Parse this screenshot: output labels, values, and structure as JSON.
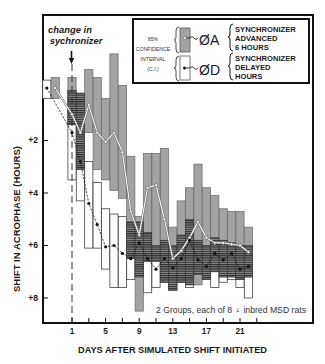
{
  "chart_data": {
    "type": "box-line",
    "title": "",
    "xlabel": "DAYS AFTER SIMULATED SHIFT INITIATED",
    "ylabel": "SHIFT IN ACROPHASE (HOURS)",
    "xlim": [
      -3.0,
      29.8
    ],
    "ylim": [
      -2.8,
      8.9
    ],
    "y_inverted": true,
    "grid": false,
    "x_ticks": [
      1,
      3,
      5,
      7,
      9,
      11,
      13,
      15,
      17,
      19,
      21,
      23
    ],
    "x_tick_labels": [
      {
        "value": 1,
        "label": "1"
      },
      {
        "value": 5,
        "label": "5"
      },
      {
        "value": 9,
        "label": "9"
      },
      {
        "value": 13,
        "label": "13"
      },
      {
        "value": 17,
        "label": "17"
      },
      {
        "value": 21,
        "label": "21"
      }
    ],
    "y_ticks": [
      {
        "value": 2,
        "label": "+2"
      },
      {
        "value": 4,
        "label": "+4"
      },
      {
        "value": 6,
        "label": "+6"
      },
      {
        "value": 8,
        "label": "+8"
      }
    ],
    "annotations": {
      "shift_marker_line1": "change in",
      "shift_marker_line2": "sychronizer",
      "shift_day": 1,
      "note": "2 Groups, each of 8 ♀ inbred MSD rats"
    },
    "legend": {
      "position": "top-right",
      "ci_label": [
        "95%",
        "CONFIDENCE",
        "INTERVAL",
        "(C.I.)"
      ],
      "items": [
        {
          "symbol": "ØA",
          "lines": [
            "SYNCHRONIZER",
            "ADVANCED",
            "6 HOURS"
          ],
          "box_fill": "#a3a3a3",
          "marker": "open-circle"
        },
        {
          "symbol": "ØD",
          "lines": [
            "SYNCHRONIZER",
            "DELAYED",
            "HOURS"
          ],
          "box_fill": "#ffffff",
          "marker": "filled-dot"
        }
      ]
    },
    "colors": {
      "advanced_box": "#a3a3a3",
      "delayed_box": "#ffffff",
      "overlap_hatch": "#222222",
      "advanced_line": "#ffffff",
      "delayed_line": "#1a1a1a"
    },
    "series": [
      {
        "name": "ØA",
        "description": "Synchronizer advanced 6 hours",
        "points": [
          {
            "day": -1,
            "mean": 0.0,
            "ci_low": -0.4,
            "ci_high": 0.4
          },
          {
            "day": 1,
            "mean": 1.0,
            "ci_low": -0.4,
            "ci_high": 1.4
          },
          {
            "day": 2,
            "mean": 1.7,
            "ci_low": 0.2,
            "ci_high": 3.1
          },
          {
            "day": 3,
            "mean": 0.65,
            "ci_low": -0.7,
            "ci_high": 1.7
          },
          {
            "day": 4,
            "mean": 1.7,
            "ci_low": -0.4,
            "ci_high": 3.1
          },
          {
            "day": 5,
            "mean": 2.05,
            "ci_low": 0.4,
            "ci_high": 3.5
          },
          {
            "day": 6,
            "mean": 1.7,
            "ci_low": -1.3,
            "ci_high": 3.9
          },
          {
            "day": 7,
            "mean": 2.45,
            "ci_low": -0.1,
            "ci_high": 4.2
          },
          {
            "day": 8,
            "mean": 4.7,
            "ci_low": 2.6,
            "ci_high": 6.5
          },
          {
            "day": 9,
            "mean": 5.6,
            "ci_low": 4.9,
            "ci_high": 8.5
          },
          {
            "day": 10,
            "mean": 3.8,
            "ci_low": 2.5,
            "ci_high": 6.6
          },
          {
            "day": 11,
            "mean": 3.7,
            "ci_low": 2.5,
            "ci_high": 6.6
          },
          {
            "day": 12,
            "mean": 5.0,
            "ci_low": 2.3,
            "ci_high": 7.4
          },
          {
            "day": 13,
            "mean": 6.5,
            "ci_low": 5.3,
            "ci_high": 7.7
          },
          {
            "day": 14,
            "mean": 6.2,
            "ci_low": 4.3,
            "ci_high": 7.4
          },
          {
            "day": 15,
            "mean": 5.7,
            "ci_low": 3.8,
            "ci_high": 7.5
          },
          {
            "day": 16,
            "mean": 5.1,
            "ci_low": 2.9,
            "ci_high": 7.5
          },
          {
            "day": 17,
            "mean": 5.7,
            "ci_low": 3.8,
            "ci_high": 7.3
          },
          {
            "day": 18,
            "mean": 5.9,
            "ci_low": 4.1,
            "ci_high": 7.0
          },
          {
            "day": 19,
            "mean": 5.9,
            "ci_low": 4.6,
            "ci_high": 7.2
          },
          {
            "day": 20,
            "mean": 5.95,
            "ci_low": 4.7,
            "ci_high": 7.2
          },
          {
            "day": 21,
            "mean": 6.0,
            "ci_low": 4.7,
            "ci_high": 7.3
          },
          {
            "day": 22,
            "mean": 6.25,
            "ci_low": 5.3,
            "ci_high": 7.2
          }
        ]
      },
      {
        "name": "ØD",
        "description": "Synchronizer delayed hours",
        "points": [
          {
            "day": -2,
            "mean": 0.0,
            "ci_low": -0.3,
            "ci_high": 0.4
          },
          {
            "day": 1,
            "mean": 1.7,
            "ci_low": 0.1,
            "ci_high": 3.5
          },
          {
            "day": 2,
            "mean": 2.8,
            "ci_low": 0.2,
            "ci_high": 4.3
          },
          {
            "day": 3,
            "mean": 4.4,
            "ci_low": 2.8,
            "ci_high": 6.1
          },
          {
            "day": 4,
            "mean": 5.2,
            "ci_low": 3.6,
            "ci_high": 6.1
          },
          {
            "day": 5,
            "mean": 6.05,
            "ci_low": 4.6,
            "ci_high": 6.9
          },
          {
            "day": 6,
            "mean": 6.0,
            "ci_low": 4.8,
            "ci_high": 7.6
          },
          {
            "day": 7,
            "mean": 6.3,
            "ci_low": 4.9,
            "ci_high": 7.6
          },
          {
            "day": 8,
            "mean": 6.5,
            "ci_low": 5.1,
            "ci_high": 7.3
          },
          {
            "day": 9,
            "mean": 5.9,
            "ci_low": 5.1,
            "ci_high": 7.2
          },
          {
            "day": 10,
            "mean": 6.5,
            "ci_low": 5.5,
            "ci_high": 7.8
          },
          {
            "day": 11,
            "mean": 6.9,
            "ci_low": 6.0,
            "ci_high": 7.6
          },
          {
            "day": 12,
            "mean": 6.5,
            "ci_low": 5.8,
            "ci_high": 7.4
          },
          {
            "day": 13,
            "mean": 6.85,
            "ci_low": 6.0,
            "ci_high": 7.7
          },
          {
            "day": 14,
            "mean": 6.5,
            "ci_low": 5.6,
            "ci_high": 7.4
          },
          {
            "day": 15,
            "mean": 5.8,
            "ci_low": 5.0,
            "ci_high": 7.6
          },
          {
            "day": 16,
            "mean": 6.55,
            "ci_low": 5.8,
            "ci_high": 7.1
          },
          {
            "day": 17,
            "mean": 6.8,
            "ci_low": 6.0,
            "ci_high": 7.3
          },
          {
            "day": 18,
            "mean": 6.3,
            "ci_low": 5.7,
            "ci_high": 7.6
          },
          {
            "day": 19,
            "mean": 6.55,
            "ci_low": 5.8,
            "ci_high": 7.4
          },
          {
            "day": 20,
            "mean": 6.3,
            "ci_low": 5.9,
            "ci_high": 7.3
          },
          {
            "day": 21,
            "mean": 6.9,
            "ci_low": 6.0,
            "ci_high": 7.6
          },
          {
            "day": 22,
            "mean": 6.8,
            "ci_low": 6.0,
            "ci_high": 8.0
          }
        ]
      }
    ]
  }
}
